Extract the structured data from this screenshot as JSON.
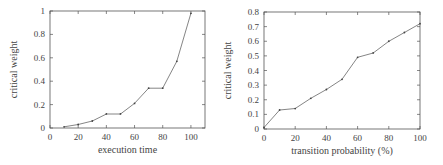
{
  "chart_data": [
    {
      "type": "line",
      "title": "",
      "xlabel": "execution time",
      "ylabel": "critical weight",
      "xlim": [
        0,
        110
      ],
      "ylim": [
        0,
        1
      ],
      "xticks": [
        0,
        20,
        40,
        60,
        80,
        100
      ],
      "yticks": [
        0,
        0.2,
        0.4,
        0.6,
        0.8,
        1
      ],
      "xtick_labels": [
        "0",
        "20",
        "40",
        "60",
        "80",
        "100"
      ],
      "ytick_labels": [
        "0",
        "0.2",
        "0.4",
        "0.6",
        "0.8",
        "1"
      ],
      "grid": false,
      "legend": null,
      "series": [
        {
          "name": "critical weight",
          "x": [
            10,
            20,
            30,
            40,
            50,
            60,
            70,
            80,
            90,
            100
          ],
          "values": [
            0.01,
            0.03,
            0.06,
            0.12,
            0.12,
            0.21,
            0.34,
            0.34,
            0.57,
            0.98
          ]
        }
      ]
    },
    {
      "type": "line",
      "title": "",
      "xlabel": "transition probability (%)",
      "ylabel": "critical weight",
      "xlim": [
        0,
        100
      ],
      "ylim": [
        0,
        0.8
      ],
      "xticks": [
        0,
        20,
        40,
        60,
        80,
        100
      ],
      "yticks": [
        0,
        0.1,
        0.2,
        0.3,
        0.4,
        0.5,
        0.6,
        0.7,
        0.8
      ],
      "xtick_labels": [
        "0",
        "20",
        "40",
        "60",
        "80",
        "100"
      ],
      "ytick_labels": [
        "0",
        "0.1",
        "0.2",
        "0.3",
        "0.4",
        "0.5",
        "0.6",
        "0.7",
        "0.8"
      ],
      "grid": false,
      "legend": null,
      "series": [
        {
          "name": "critical weight",
          "x": [
            0,
            10,
            20,
            30,
            40,
            50,
            60,
            70,
            80,
            90,
            100
          ],
          "values": [
            0.01,
            0.13,
            0.14,
            0.21,
            0.27,
            0.34,
            0.49,
            0.52,
            0.6,
            0.66,
            0.72
          ]
        }
      ]
    }
  ],
  "style": {
    "axis_color": "#555555",
    "line_color": "#777777",
    "text_color": "#444444"
  }
}
